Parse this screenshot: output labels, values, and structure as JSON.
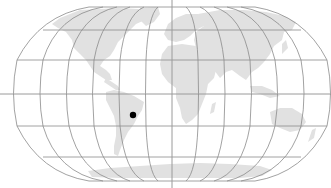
{
  "map": {
    "projection": "Robinson",
    "width": 331,
    "height": 188,
    "colors": {
      "background": "#ffffff",
      "land": "#e1e1e1",
      "graticule": "#8a8a8a",
      "axis": "#9a9a9a",
      "marker": "#000000"
    },
    "graticule": {
      "meridian_step_deg": 30,
      "parallel_step_deg": 30
    },
    "marker": {
      "label": "location-marker",
      "x": 133,
      "y": 115,
      "radius": 3.2,
      "region": "South America (southern Brazil / Paraguay)"
    }
  }
}
